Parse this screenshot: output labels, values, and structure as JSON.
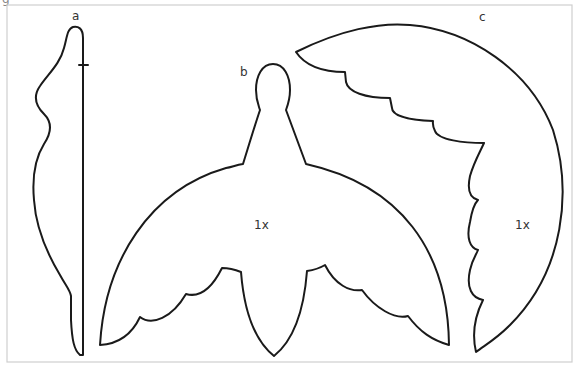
{
  "corner_mark": "g",
  "pieces": [
    {
      "id": "a",
      "label": "a"
    },
    {
      "id": "b",
      "label": "b",
      "scale_label": "1x"
    },
    {
      "id": "c",
      "label": "c",
      "scale_label": "1x"
    }
  ]
}
